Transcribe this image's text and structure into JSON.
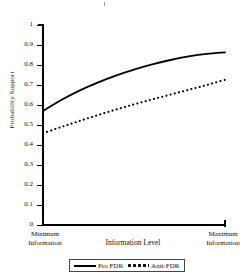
{
  "chart_data": {
    "type": "line",
    "title": "",
    "xlabel": "Information Level",
    "ylabel": "Probability Support",
    "ylim": [
      0,
      1
    ],
    "grid": false,
    "legend_position": "bottom-center",
    "x_axis": {
      "min_label_line1": "Minimum",
      "min_label_line2": "Information",
      "max_label_line1": "Maximum",
      "max_label_line2": "Information"
    },
    "y_ticks": [
      "1",
      "0.9",
      "0.8",
      "0.7",
      "0.6",
      "0.5",
      "0.4",
      "0.3",
      "0.2",
      "0.1",
      "0"
    ],
    "y_tick_values": [
      1,
      0.9,
      0.8,
      0.7,
      0.6,
      0.5,
      0.4,
      0.3,
      0.2,
      0.1,
      0
    ],
    "x": [
      0,
      0.1,
      0.2,
      0.3,
      0.4,
      0.5,
      0.6,
      0.7,
      0.8,
      0.9,
      1
    ],
    "series": [
      {
        "name": "Pro FDR",
        "style": "solid",
        "color": "#000000",
        "values": [
          0.57,
          0.625,
          0.672,
          0.712,
          0.747,
          0.777,
          0.803,
          0.825,
          0.843,
          0.856,
          0.863
        ]
      },
      {
        "name": "Anti-FDR",
        "style": "dotted",
        "color": "#000000",
        "values": [
          0.459,
          0.49,
          0.52,
          0.549,
          0.577,
          0.603,
          0.628,
          0.652,
          0.676,
          0.7,
          0.726
        ]
      }
    ]
  },
  "legend": {
    "entries": [
      {
        "label": "Pro FDR"
      },
      {
        "label": "Anti-FDR"
      }
    ]
  }
}
